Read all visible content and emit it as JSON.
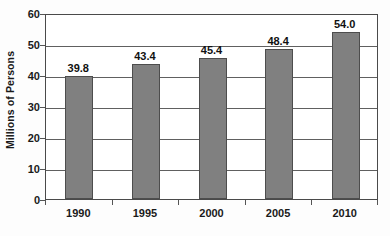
{
  "chart_data": {
    "type": "bar",
    "title": "",
    "subtitle": "",
    "xlabel": "",
    "ylabel": "Millions of Persons",
    "categories": [
      "1990",
      "1995",
      "2000",
      "2005",
      "2010"
    ],
    "values": [
      39.8,
      43.4,
      45.4,
      48.4,
      54.0
    ],
    "data_labels": [
      "39.8",
      "43.4",
      "45.4",
      "48.4",
      "54.0"
    ],
    "ylim": [
      0,
      60
    ],
    "yticks": [
      0,
      10,
      20,
      30,
      40,
      50,
      60
    ],
    "ytick_labels": [
      "0",
      "10",
      "20",
      "30",
      "40",
      "50",
      "60"
    ],
    "grid": "horizontal",
    "legend": "none",
    "series": [
      {
        "name": "Millions of Persons",
        "values": [
          39.8,
          43.4,
          45.4,
          48.4,
          54.0
        ],
        "color": "#808080"
      }
    ],
    "colors": {
      "bar_fill": "#808080",
      "bar_stroke": "#4d4d4d",
      "gridline": "#606060",
      "axis": "#4a4a4a",
      "text": "#1a1a1a",
      "plot_background": "#ffffff",
      "figure_background": "#fdfdfd"
    }
  }
}
